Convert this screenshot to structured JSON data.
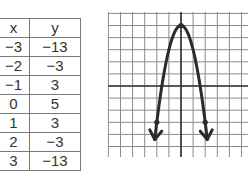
{
  "table": {
    "headers": [
      "x",
      "y"
    ],
    "rows": [
      [
        "−3",
        "−13"
      ],
      [
        "−2",
        "−3"
      ],
      [
        "−1",
        "3"
      ],
      [
        "0",
        "5"
      ],
      [
        "1",
        "3"
      ],
      [
        "2",
        "−3"
      ],
      [
        "3",
        "−13"
      ]
    ]
  },
  "chart_data": [
    {
      "type": "table",
      "title": "",
      "columns": [
        "x",
        "y"
      ],
      "rows": [
        [
          -3,
          -13
        ],
        [
          -2,
          -3
        ],
        [
          -1,
          3
        ],
        [
          0,
          5
        ],
        [
          1,
          3
        ],
        [
          2,
          -3
        ],
        [
          3,
          -13
        ]
      ]
    },
    {
      "type": "line",
      "title": "",
      "xlabel": "",
      "ylabel": "",
      "function": "y = -2x^2 + 5",
      "grid": true,
      "xlim": [
        -6,
        5.5
      ],
      "ylim": [
        -6,
        6
      ],
      "x": [
        -2.25,
        -2,
        -1.5,
        -1,
        -0.5,
        0,
        0.5,
        1,
        1.5,
        2,
        2.25
      ],
      "y": [
        -5.125,
        -3,
        0.5,
        3,
        4.5,
        5,
        4.5,
        3,
        0.5,
        -3,
        -5.125
      ],
      "marked_points": [
        [
          0,
          5
        ],
        [
          -2,
          -3
        ],
        [
          2,
          -3
        ]
      ],
      "arrows": "both ends downward",
      "color": "#2b2b2b"
    }
  ]
}
